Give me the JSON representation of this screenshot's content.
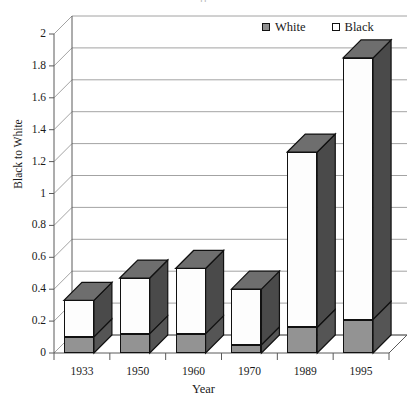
{
  "chart_title_fragment": "fi",
  "legend": {
    "position": "top-right",
    "entries": [
      {
        "label": "White",
        "swatch": "filled-gray-square-icon",
        "color": "#8f8f8f"
      },
      {
        "label": "Black",
        "swatch": "outlined-white-square-icon",
        "color": "#ffffff"
      }
    ]
  },
  "axes": {
    "y_title": "Black to White",
    "x_title": "Year"
  },
  "chart_data": {
    "type": "bar",
    "title": "",
    "xlabel": "Year",
    "ylabel": "Black to White",
    "stacked": true,
    "three_d": true,
    "grid": true,
    "legend_position": "top-right",
    "categories": [
      "1933",
      "1950",
      "1960",
      "1970",
      "1989",
      "1995"
    ],
    "ylim": [
      0,
      2
    ],
    "ytick_step": 0.2,
    "yticks": [
      "0",
      "0.2",
      "0.4",
      "0.6",
      "0.8",
      "1",
      "1.2",
      "1.4",
      "1.6",
      "1.8",
      "2"
    ],
    "series": [
      {
        "name": "White",
        "color": "#8f8f8f",
        "values": [
          0.1,
          0.12,
          0.12,
          0.05,
          0.16,
          0.21
        ]
      },
      {
        "name": "Black",
        "color": "#ffffff",
        "values": [
          0.23,
          0.35,
          0.41,
          0.35,
          1.1,
          1.64
        ]
      }
    ],
    "totals": [
      0.33,
      0.47,
      0.53,
      0.4,
      1.26,
      1.85
    ]
  }
}
